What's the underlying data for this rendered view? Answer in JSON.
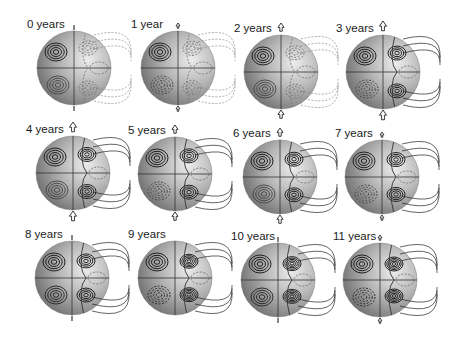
{
  "figure": {
    "type": "multi-panel sphere contour plot",
    "panels": [
      {
        "label": "0 years",
        "cx": 74,
        "cy": 68,
        "marker": "tick"
      },
      {
        "label": "1 year",
        "cx": 178,
        "cy": 68,
        "marker": "small-arrow"
      },
      {
        "label": "2 years",
        "cx": 281,
        "cy": 72,
        "marker": "arrow"
      },
      {
        "label": "3 years",
        "cx": 383,
        "cy": 72,
        "marker": "big-arrow"
      },
      {
        "label": "4 years",
        "cx": 73,
        "cy": 173,
        "marker": "big-arrow"
      },
      {
        "label": "5 years",
        "cx": 175,
        "cy": 174,
        "marker": "arrow"
      },
      {
        "label": "6 years",
        "cx": 280,
        "cy": 177,
        "marker": "arrow"
      },
      {
        "label": "7 years",
        "cx": 382,
        "cy": 177,
        "marker": "small-arrow"
      },
      {
        "label": "8 years",
        "cx": 72,
        "cy": 278,
        "marker": "tick"
      },
      {
        "label": "9 years",
        "cx": 175,
        "cy": 278,
        "marker": "none"
      },
      {
        "label": "10 years",
        "cx": 278,
        "cy": 280,
        "marker": "tick"
      },
      {
        "label": "11 years",
        "cx": 380,
        "cy": 280,
        "marker": "small-arrow"
      }
    ],
    "colors": {
      "sphere_dark": "#6e6e6e",
      "sphere_mid": "#a9a9a9",
      "sphere_light": "#e4e4e4",
      "contour_solid": "#222222",
      "contour_dashed": "#777777"
    }
  }
}
